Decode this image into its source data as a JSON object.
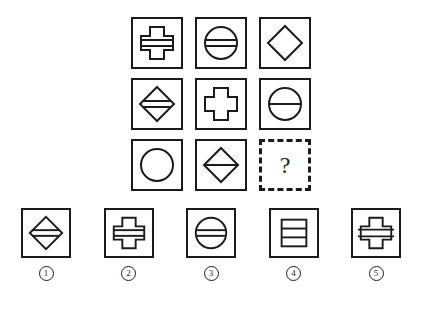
{
  "puzzle": {
    "type": "visual-analogy-matrix",
    "grid": {
      "rows": 3,
      "cols": 3,
      "cells": [
        {
          "id": "r1c1",
          "shape": "cross",
          "marking": "band",
          "label": "cross with horizontal band"
        },
        {
          "id": "r1c2",
          "shape": "circle",
          "marking": "band",
          "label": "circle with horizontal band"
        },
        {
          "id": "r1c3",
          "shape": "diamond",
          "marking": "none",
          "label": "plain diamond"
        },
        {
          "id": "r2c1",
          "shape": "diamond",
          "marking": "band",
          "label": "diamond with horizontal band"
        },
        {
          "id": "r2c2",
          "shape": "cross",
          "marking": "none",
          "label": "plain cross"
        },
        {
          "id": "r2c3",
          "shape": "circle",
          "marking": "line",
          "label": "circle with single horizontal line"
        },
        {
          "id": "r3c1",
          "shape": "circle",
          "marking": "none",
          "label": "plain circle"
        },
        {
          "id": "r3c2",
          "shape": "diamond",
          "marking": "line",
          "label": "diamond with single horizontal line"
        },
        {
          "id": "r3c3",
          "shape": "missing",
          "marking": "none",
          "label": "?"
        }
      ]
    },
    "missing_cell": {
      "text": "?",
      "border_style": "dashed"
    },
    "options": [
      {
        "number": "1",
        "shape": "diamond",
        "marking": "band",
        "label": "diamond with horizontal band"
      },
      {
        "number": "2",
        "shape": "cross",
        "marking": "band",
        "label": "cross with horizontal band"
      },
      {
        "number": "3",
        "shape": "circle",
        "marking": "band",
        "label": "circle with horizontal band"
      },
      {
        "number": "4",
        "shape": "square",
        "marking": "two-lines",
        "label": "square divided by two horizontal lines"
      },
      {
        "number": "5",
        "shape": "cross",
        "marking": "wide-band",
        "label": "cross with wide horizontal band"
      }
    ]
  },
  "colors": {
    "ink": "#1b1b1b",
    "background": "#ffffff"
  }
}
